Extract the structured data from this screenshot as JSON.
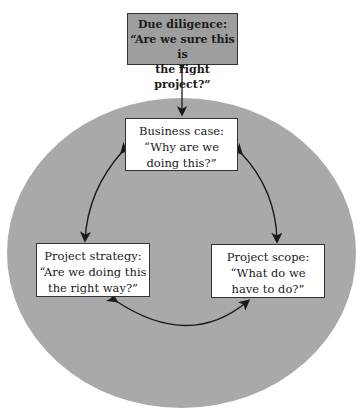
{
  "diagram": {
    "top": {
      "title": "Due diligence:",
      "line1": "“Are we sure this is",
      "line2": "the right project?”"
    },
    "business": {
      "title": "Business case:",
      "line1": "“Why are we",
      "line2": "doing this?”"
    },
    "strategy": {
      "title": "Project strategy:",
      "line1": "“Are we doing this",
      "line2": "the right way?”"
    },
    "scope": {
      "title": "Project scope:",
      "line1": "“What do we",
      "line2": "have to do?”"
    },
    "colors": {
      "ellipse": "#a9a9a9",
      "top_box": "#9e9e9e",
      "box": "#ffffff",
      "arrow": "#1a1a1a"
    }
  }
}
